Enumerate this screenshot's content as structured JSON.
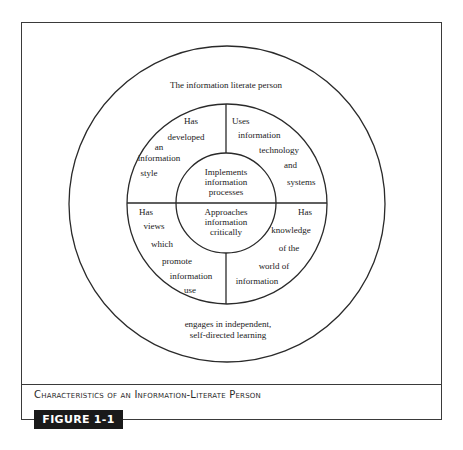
{
  "figure": {
    "caption": "Characteristics of an Information-Literate Person",
    "label": "FIGURE 1-1"
  },
  "diagram": {
    "outer_ring": {
      "title": "The information literate person",
      "bottom_lines": [
        "engages in independent,",
        "self-directed learning"
      ]
    },
    "quadrants": {
      "top_left": [
        "Has",
        "developed",
        "an",
        "information",
        "style"
      ],
      "top_right": [
        "Uses",
        "information",
        "technology",
        "and",
        "systems"
      ],
      "bottom_left": [
        "Has",
        "views",
        "which",
        "promote",
        "information",
        "use"
      ],
      "bottom_right": [
        "Has",
        "knowledge",
        "of the",
        "world of",
        "information"
      ]
    },
    "center": {
      "top": [
        "Implements",
        "information",
        "processes"
      ],
      "bottom": [
        "Approaches",
        "information",
        "critically"
      ]
    }
  }
}
